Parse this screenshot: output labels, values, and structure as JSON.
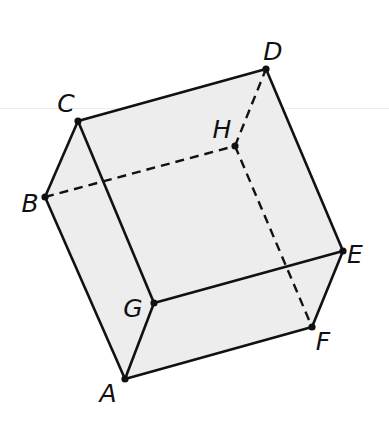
{
  "figure": {
    "type": "rectangular prism (cuboid) oblique view",
    "fill_color": "#ededed",
    "stroke_color": "#111111",
    "vertices": {
      "A": {
        "x": 125,
        "y": 379,
        "label_x": 108,
        "label_y": 393
      },
      "B": {
        "x": 45,
        "y": 197,
        "label_x": 30,
        "label_y": 203
      },
      "C": {
        "x": 78,
        "y": 121,
        "label_x": 66,
        "label_y": 103
      },
      "D": {
        "x": 266,
        "y": 69,
        "label_x": 273,
        "label_y": 51
      },
      "E": {
        "x": 343,
        "y": 251,
        "label_x": 355,
        "label_y": 254
      },
      "F": {
        "x": 312,
        "y": 327,
        "label_x": 323,
        "label_y": 341
      },
      "G": {
        "x": 154,
        "y": 303,
        "label_x": 133,
        "label_y": 308
      },
      "H": {
        "x": 235,
        "y": 146,
        "label_x": 222,
        "label_y": 129
      }
    },
    "labels": {
      "A": "A",
      "B": "B",
      "C": "C",
      "D": "D",
      "E": "E",
      "F": "F",
      "G": "G",
      "H": "H"
    },
    "solid_edges": [
      "CD",
      "DE",
      "EG",
      "GC",
      "CB",
      "BA",
      "AG",
      "AF",
      "FE"
    ],
    "hidden_edges": [
      "BH",
      "HD",
      "HF"
    ]
  }
}
